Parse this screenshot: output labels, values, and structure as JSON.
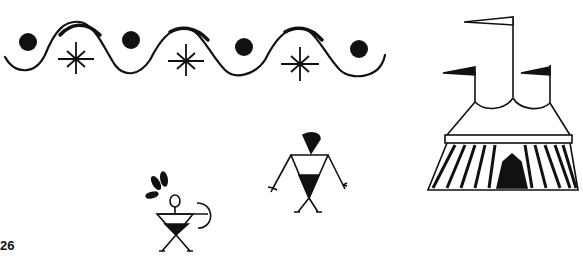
{
  "page": {
    "page_number": "26",
    "ink_color": "#111111",
    "background": "#ffffff"
  },
  "illustrations": [
    {
      "name": "wavy-border",
      "elements": [
        "wave-line",
        "dot",
        "star",
        "dot",
        "star",
        "dot",
        "star",
        "dot"
      ]
    },
    {
      "name": "circus-tent",
      "flags": 3
    },
    {
      "name": "archer-figure",
      "holds": "bow"
    },
    {
      "name": "standing-figure"
    }
  ]
}
